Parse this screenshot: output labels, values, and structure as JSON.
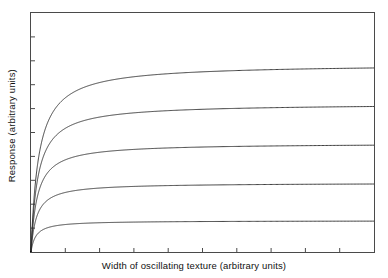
{
  "chart_data": {
    "type": "line",
    "title": "",
    "xlabel": "Width of oscillating texture (arbitrary units)",
    "ylabel": "Response (arbitrary units)",
    "xlim": [
      0,
      10
    ],
    "ylim": [
      0,
      10
    ],
    "grid": false,
    "legend": null,
    "x_ticks": [
      1,
      2,
      3,
      4,
      5,
      6,
      7,
      8,
      9
    ],
    "y_ticks": [
      1,
      2,
      3,
      4,
      5,
      6,
      7,
      8,
      9
    ],
    "tick_labels_shown": false,
    "tick_direction": "in",
    "frame": "box",
    "line_color": "#2b2b2b",
    "background_color": "#ffffff",
    "x": [
      0,
      0.05,
      0.1,
      0.15,
      0.2,
      0.3,
      0.4,
      0.5,
      0.7,
      1.0,
      1.4,
      2.0,
      3.0,
      4.0,
      5.0,
      6.0,
      7.0,
      8.0,
      9.0,
      10.0
    ],
    "series": [
      {
        "name": "curve-1",
        "asymptote": 7.87,
        "half_saturation": 0.22,
        "values": [
          0,
          1.44,
          2.46,
          3.19,
          3.75,
          4.53,
          5.05,
          5.42,
          5.91,
          6.34,
          6.71,
          7.04,
          7.33,
          7.46,
          7.54,
          7.59,
          7.63,
          7.66,
          7.69,
          7.71
        ]
      },
      {
        "name": "curve-2",
        "asymptote": 6.21,
        "half_saturation": 0.2,
        "values": [
          0,
          1.24,
          2.07,
          2.66,
          3.11,
          3.73,
          4.14,
          4.44,
          4.82,
          5.18,
          5.47,
          5.74,
          5.97,
          6.08,
          6.15,
          6.19,
          6.22,
          6.25,
          6.27,
          6.29
        ]
      },
      {
        "name": "curve-3",
        "asymptote": 4.55,
        "half_saturation": 0.18,
        "values": [
          0,
          0.99,
          1.62,
          2.07,
          2.39,
          2.85,
          3.15,
          3.36,
          3.64,
          3.89,
          4.09,
          4.27,
          4.43,
          4.5,
          4.55,
          4.58,
          4.6,
          4.61,
          4.63,
          4.64
        ]
      },
      {
        "name": "curve-4",
        "asymptote": 2.89,
        "half_saturation": 0.16,
        "values": [
          0,
          0.69,
          1.11,
          1.4,
          1.61,
          1.89,
          2.07,
          2.2,
          2.36,
          2.5,
          2.61,
          2.71,
          2.8,
          2.84,
          2.86,
          2.88,
          2.89,
          2.9,
          2.9,
          2.91
        ]
      },
      {
        "name": "curve-5",
        "asymptote": 1.31,
        "half_saturation": 0.14,
        "values": [
          0,
          0.34,
          0.54,
          0.67,
          0.77,
          0.89,
          0.96,
          1.02,
          1.09,
          1.14,
          1.19,
          1.22,
          1.26,
          1.27,
          1.28,
          1.29,
          1.3,
          1.3,
          1.31,
          1.31
        ]
      }
    ]
  },
  "axes": {
    "xlabel": "Width of oscillating texture (arbitrary units)",
    "ylabel": "Response (arbitrary units)"
  }
}
